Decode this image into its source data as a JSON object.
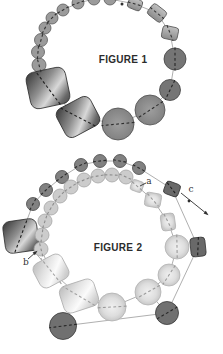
{
  "figure1": {
    "caption": "FIGURE 1",
    "beads": [
      {
        "t": "c",
        "x": 39,
        "y": 65,
        "r": 7,
        "s": "f1small"
      },
      {
        "t": "c",
        "x": 38,
        "y": 52,
        "r": 6.5,
        "s": "f1small"
      },
      {
        "t": "c",
        "x": 41,
        "y": 40,
        "r": 6.5,
        "s": "f1small"
      },
      {
        "t": "c",
        "x": 45,
        "y": 28,
        "r": 6,
        "s": "f1small"
      },
      {
        "t": "c",
        "x": 52,
        "y": 18,
        "r": 6,
        "s": "f1small"
      },
      {
        "t": "c",
        "x": 63,
        "y": 10,
        "r": 6,
        "s": "f1small"
      },
      {
        "t": "c",
        "x": 78,
        "y": 3,
        "r": 6,
        "s": "f1small"
      },
      {
        "t": "c",
        "x": 94,
        "y": -1,
        "r": 6,
        "s": "f1small"
      },
      {
        "t": "c",
        "x": 110,
        "y": -1,
        "r": 6,
        "s": "f1small"
      },
      {
        "t": "r",
        "x": 135,
        "y": 4,
        "w": 14,
        "h": 11,
        "rot": 22,
        "rx": 3,
        "s": "grayRect"
      },
      {
        "t": "r",
        "x": 157,
        "y": 13,
        "w": 17,
        "h": 13,
        "rot": 38,
        "rx": 3,
        "s": "grayRect"
      },
      {
        "t": "r",
        "x": 170,
        "y": 33,
        "w": 16,
        "h": 13,
        "rot": 12,
        "rx": 3,
        "s": "grayRect"
      },
      {
        "t": "c",
        "x": 175,
        "y": 59,
        "r": 11,
        "s": "f1dark"
      },
      {
        "t": "c",
        "x": 170,
        "y": 90,
        "r": 10.5,
        "s": "f1dark"
      },
      {
        "t": "c",
        "x": 150,
        "y": 110,
        "r": 15,
        "s": "f1big"
      },
      {
        "t": "c",
        "x": 118,
        "y": 124,
        "r": 16,
        "s": "f1big"
      },
      {
        "t": "r",
        "x": 78,
        "y": 117,
        "w": 38,
        "h": 32,
        "rot": -28,
        "rx": 7,
        "s": "darkCyl"
      },
      {
        "t": "r",
        "x": 48,
        "y": 88,
        "w": 40,
        "h": 37,
        "rot": -12,
        "rx": 8,
        "s": "darkCyl"
      }
    ],
    "chains": [
      {
        "beads": [
          0,
          1,
          2,
          3,
          4,
          5,
          6,
          7,
          8,
          9,
          10,
          11,
          12,
          13,
          14,
          15,
          16,
          17
        ],
        "closed": true
      }
    ],
    "links": []
  },
  "figure2": {
    "caption": "FIGURE 2",
    "labels": {
      "a": "a",
      "b": "b",
      "c": "c"
    },
    "beads": [
      {
        "t": "r",
        "x": 21,
        "y": 236,
        "w": 34,
        "h": 32,
        "rot": -8,
        "rx": 7,
        "s": "darkCyl"
      },
      {
        "t": "c",
        "x": 33,
        "y": 204,
        "r": 6.5,
        "s": "f2outer"
      },
      {
        "t": "c",
        "x": 46,
        "y": 190,
        "r": 6.5,
        "s": "f2outer"
      },
      {
        "t": "c",
        "x": 62,
        "y": 177,
        "r": 6.5,
        "s": "f2outer"
      },
      {
        "t": "c",
        "x": 81,
        "y": 165,
        "r": 6.5,
        "s": "f2outer"
      },
      {
        "t": "c",
        "x": 100,
        "y": 161,
        "r": 6.5,
        "s": "f2outer"
      },
      {
        "t": "c",
        "x": 120,
        "y": 161,
        "r": 6.5,
        "s": "f2outer"
      },
      {
        "t": "c",
        "x": 139,
        "y": 168,
        "r": 6.5,
        "s": "f2outer"
      },
      {
        "t": "r",
        "x": 172,
        "y": 189,
        "w": 15,
        "h": 13,
        "rot": 20,
        "rx": 3,
        "s": "f2darkBead"
      },
      {
        "t": "r",
        "x": 198,
        "y": 247,
        "w": 15,
        "h": 19,
        "rot": -6,
        "rx": 3.5,
        "s": "f2darkBead"
      },
      {
        "t": "c",
        "x": 167,
        "y": 313,
        "r": 11.5,
        "s": "f2darkCircle"
      },
      {
        "t": "c",
        "x": 63,
        "y": 326,
        "r": 13.5,
        "s": "f2darkCircle"
      },
      {
        "t": "c",
        "x": 41,
        "y": 249,
        "r": 7,
        "s": "f2innerSmall"
      },
      {
        "t": "c",
        "x": 42,
        "y": 235,
        "r": 7,
        "s": "f2innerSmall"
      },
      {
        "t": "c",
        "x": 45,
        "y": 221,
        "r": 7,
        "s": "f2innerSmall"
      },
      {
        "t": "c",
        "x": 51,
        "y": 208,
        "r": 7,
        "s": "f2innerSmall"
      },
      {
        "t": "c",
        "x": 60,
        "y": 196,
        "r": 7,
        "s": "f2innerSmall"
      },
      {
        "t": "c",
        "x": 71,
        "y": 187,
        "r": 7,
        "s": "f2innerSmall"
      },
      {
        "t": "c",
        "x": 84,
        "y": 180,
        "r": 7,
        "s": "f2innerSmall"
      },
      {
        "t": "c",
        "x": 98,
        "y": 176,
        "r": 7,
        "s": "f2innerSmall"
      },
      {
        "t": "c",
        "x": 112,
        "y": 175,
        "r": 7,
        "s": "f2innerSmall"
      },
      {
        "t": "c",
        "x": 126,
        "y": 177,
        "r": 7,
        "s": "f2innerSmall"
      },
      {
        "t": "r",
        "x": 137,
        "y": 186,
        "w": 12,
        "h": 11,
        "rot": 20,
        "rx": 2.5,
        "s": "f2light"
      },
      {
        "t": "r",
        "x": 153,
        "y": 200,
        "w": 16,
        "h": 14,
        "rot": 10,
        "rx": 3,
        "s": "f2light"
      },
      {
        "t": "r",
        "x": 168,
        "y": 222,
        "w": 14,
        "h": 17,
        "rot": -8,
        "rx": 3.5,
        "s": "f2light"
      },
      {
        "t": "c",
        "x": 177,
        "y": 247,
        "r": 12,
        "s": "f2light"
      },
      {
        "t": "c",
        "x": 169,
        "y": 275,
        "r": 11,
        "s": "f2light"
      },
      {
        "t": "c",
        "x": 148,
        "y": 292,
        "r": 13,
        "s": "f2light"
      },
      {
        "t": "c",
        "x": 112,
        "y": 307,
        "r": 14,
        "s": "f2light"
      },
      {
        "t": "r",
        "x": 79,
        "y": 296,
        "w": 36,
        "h": 28,
        "rot": -18,
        "rx": 7,
        "s": "lightCyl"
      },
      {
        "t": "r",
        "x": 51,
        "y": 271,
        "w": 32,
        "h": 27,
        "rot": -28,
        "rx": 7,
        "s": "lightCyl"
      }
    ],
    "chains": [
      {
        "beads": [
          0,
          1,
          2,
          3,
          4,
          5,
          6,
          7,
          8,
          9,
          10,
          11
        ],
        "closed": false
      },
      {
        "beads": [
          12,
          13,
          14,
          15,
          16,
          17,
          18,
          19,
          20,
          21,
          22,
          23,
          24,
          25,
          26,
          27,
          28,
          29,
          30
        ],
        "closed": true
      }
    ],
    "links": [
      [
        0,
        30
      ],
      [
        11,
        29
      ],
      [
        10,
        27
      ]
    ]
  },
  "annotations": [
    {
      "name": "figure1-string-end",
      "dot": {
        "x": 122,
        "y": 4,
        "r": 1.5
      }
    },
    {
      "name": "label-a-leader",
      "line": {
        "x1": 146,
        "y1": 183,
        "x2": 140,
        "y2": 186
      }
    },
    {
      "name": "label-b-arrow",
      "line": {
        "x1": 28,
        "y1": 259,
        "x2": 36,
        "y2": 252
      },
      "arrow": true
    },
    {
      "name": "label-c-arrow",
      "line": {
        "x1": 181,
        "y1": 193,
        "x2": 207,
        "y2": 214
      },
      "arrow": true,
      "dot": {
        "x": 189,
        "y": 201,
        "r": 1.4
      }
    }
  ],
  "styles": {
    "f1small": {
      "fill": "#9b9b9b",
      "stroke": "#5c5c5c",
      "dash": "#333333"
    },
    "f1dark": {
      "fill": "#757575",
      "stroke": "#414141",
      "dash": "#262626"
    },
    "f1big": {
      "fill": "grad:midCircle",
      "stroke": "#4f4f4f",
      "dash": "#2e2e2e"
    },
    "grayRect": {
      "fill": "grad:grayRect",
      "stroke": "#565656",
      "dash": "#383838"
    },
    "darkCyl": {
      "fill": "grad:darkCyl",
      "stroke": "#303030",
      "dash": "#1f1f1f"
    },
    "f2outer": {
      "fill": "#818181",
      "stroke": "#484848",
      "dash": "#2b2b2b"
    },
    "f2darkBead": {
      "fill": "#696969",
      "stroke": "#363636",
      "dash": "#1f1f1f"
    },
    "f2darkCircle": {
      "fill": "#707070",
      "stroke": "#3a3a3a",
      "dash": "#262626"
    },
    "f2innerSmall": {
      "fill": "#cccccc",
      "stroke": "#a6a6a6",
      "dash": "#8d8d8d"
    },
    "f2light": {
      "fill": "grad:lightBead",
      "stroke": "#b3b3b3",
      "dash": "#9a9a9a"
    },
    "lightCyl": {
      "fill": "grad:lightCyl",
      "stroke": "#b0b0b0",
      "dash": "#a2a2a2"
    }
  },
  "gradients": {
    "darkCyl": {
      "type": "linear",
      "coords": [
        0,
        0,
        1,
        1
      ],
      "stops": [
        [
          0,
          "#333333"
        ],
        [
          0.4,
          "#8f8f8f"
        ],
        [
          0.62,
          "#d8d8d8"
        ],
        [
          0.85,
          "#6a6a6a"
        ],
        [
          1,
          "#454545"
        ]
      ]
    },
    "lightCyl": {
      "type": "linear",
      "coords": [
        0,
        0,
        1,
        1
      ],
      "stops": [
        [
          0,
          "#b8b8b8"
        ],
        [
          0.35,
          "#e2e2e2"
        ],
        [
          0.6,
          "#fbfbfb"
        ],
        [
          0.85,
          "#d0d0d0"
        ],
        [
          1,
          "#bdbdbd"
        ]
      ]
    },
    "grayRect": {
      "type": "linear",
      "coords": [
        0,
        0,
        0,
        1
      ],
      "stops": [
        [
          0,
          "#c0c0c0"
        ],
        [
          1,
          "#8c8c8c"
        ]
      ]
    },
    "lightBead": {
      "type": "radial",
      "stops": [
        [
          0,
          "#f0f0f0"
        ],
        [
          0.65,
          "#dedede"
        ],
        [
          1,
          "#c8c8c8"
        ]
      ]
    },
    "midCircle": {
      "type": "radial",
      "stops": [
        [
          0,
          "#9e9e9e"
        ],
        [
          1,
          "#828282"
        ]
      ]
    }
  },
  "colors": {
    "background": "#ffffff",
    "string": "#9b9b9b",
    "annotation": "#2f2f2f",
    "caption_text": "#2b2b2b"
  }
}
